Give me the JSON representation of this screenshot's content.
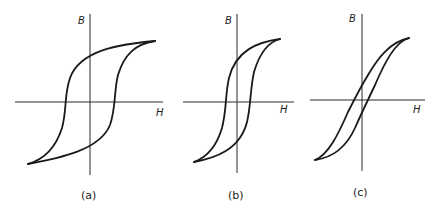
{
  "figure": {
    "panels": [
      {
        "id": "a",
        "caption": "(a)",
        "x_axis_label": "H",
        "y_axis_label": "B",
        "description": "Wide hysteresis loop"
      },
      {
        "id": "b",
        "caption": "(b)",
        "x_axis_label": "H",
        "y_axis_label": "B",
        "description": "Medium hysteresis loop"
      },
      {
        "id": "c",
        "caption": "(c)",
        "x_axis_label": "H",
        "y_axis_label": "B",
        "description": "Narrow hysteresis loop"
      }
    ]
  },
  "colors": {
    "line": "#1a1a1a",
    "background": "#ffffff"
  }
}
